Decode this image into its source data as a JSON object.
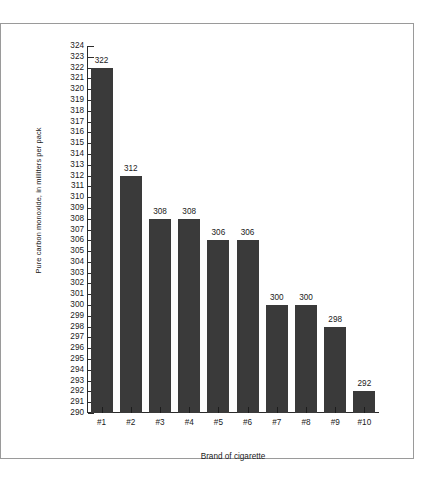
{
  "chart_data": {
    "type": "bar",
    "title": "",
    "xlabel": "Brand of cigarette",
    "ylabel": "Pure carbon monoxide, in milliters per pack",
    "categories": [
      "#1",
      "#2",
      "#3",
      "#4",
      "#5",
      "#6",
      "#7",
      "#8",
      "#9",
      "#10"
    ],
    "values": [
      322,
      312,
      308,
      308,
      306,
      306,
      300,
      300,
      298,
      292
    ],
    "value_labels": [
      "322",
      "312",
      "308",
      "308",
      "306",
      "306",
      "300",
      "300",
      "298",
      "292"
    ],
    "ylim": [
      290,
      324
    ],
    "ytick_step": 1,
    "yticks": [
      324,
      323,
      322,
      321,
      320,
      319,
      318,
      317,
      316,
      315,
      314,
      313,
      312,
      311,
      310,
      309,
      308,
      307,
      306,
      305,
      304,
      303,
      302,
      301,
      300,
      299,
      298,
      297,
      296,
      295,
      294,
      293,
      292,
      291,
      290
    ],
    "ytick_labels": [
      "324",
      "323",
      "322",
      "321",
      "320",
      "319",
      "318",
      "317",
      "316",
      "315",
      "314",
      "313",
      "312",
      "311",
      "310",
      "309",
      "308",
      "307",
      "306",
      "305",
      "304",
      "303",
      "302",
      "301",
      "300",
      "299",
      "298",
      "297",
      "296",
      "295",
      "294",
      "293",
      "292",
      "291",
      "290"
    ],
    "grid": false,
    "legend": null,
    "bar_color": "#3a3a3a",
    "axis_color": "#2b2b2b",
    "frame_color": "#9a9a9a",
    "background_color": "#ffffff"
  }
}
